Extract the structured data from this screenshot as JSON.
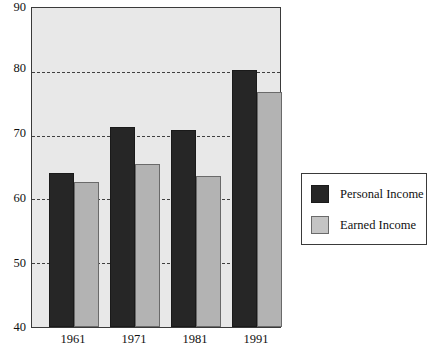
{
  "chart_data": {
    "type": "bar",
    "title": "",
    "subtitle": "",
    "xlabel": "",
    "ylabel": "",
    "categories": [
      "1961",
      "1971",
      "1981",
      "1991"
    ],
    "series": [
      {
        "name": "Personal Income",
        "color": "#262626",
        "values": [
          64.2,
          71.4,
          70.8,
          80.3
        ]
      },
      {
        "name": "Earned Income",
        "color": "#b3b3b3",
        "values": [
          62.8,
          65.6,
          63.7,
          76.9
        ]
      }
    ],
    "ylim": [
      40,
      90
    ],
    "yticks": [
      40,
      50,
      60,
      70,
      80,
      90
    ],
    "ytick_labels": [
      "40",
      "50",
      "60",
      "70",
      "80",
      "90"
    ],
    "gridlines": [
      50,
      60,
      70,
      80
    ],
    "grid": true,
    "grid_style": "dashed",
    "legend_position": "right",
    "plot_background": "#e8e8e8"
  },
  "legend": {
    "entries": [
      {
        "label": "Personal Income",
        "swatch": "dark-square-swatch"
      },
      {
        "label": "Earned Income",
        "swatch": "light-square-swatch"
      }
    ]
  },
  "axes": {
    "y_labels": [
      "90",
      "80",
      "70",
      "60",
      "50",
      "40"
    ],
    "x_labels": [
      "1961",
      "1971",
      "1981",
      "1991"
    ]
  }
}
